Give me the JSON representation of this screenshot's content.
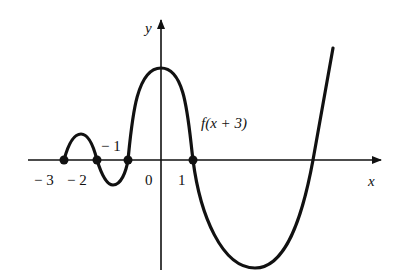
{
  "figure": {
    "axes": {
      "x_label": "x",
      "y_label": "y"
    },
    "tick_labels": {
      "neg3": "− 3",
      "neg2": "− 2",
      "neg1": "− 1",
      "zero": "0",
      "one": "1"
    },
    "curve_label": "f(x + 3)",
    "zeros": [
      -3,
      -2,
      -1,
      1
    ],
    "colors": {
      "curve": "#111111",
      "axis": "#111111",
      "background": "#ffffff"
    }
  }
}
